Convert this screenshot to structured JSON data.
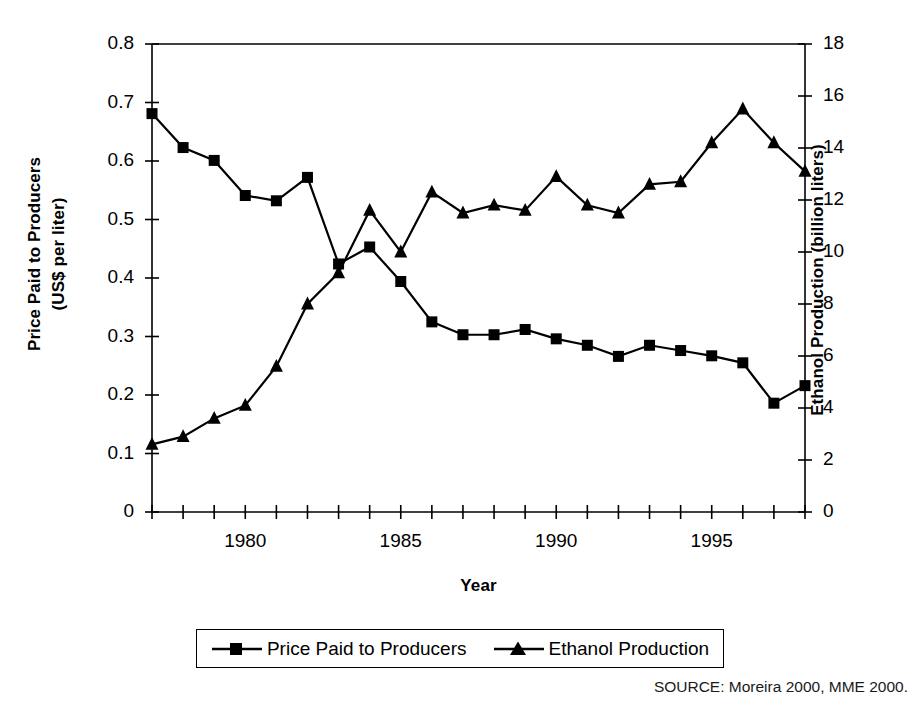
{
  "chart_data": {
    "type": "line",
    "title": "",
    "xlabel": "Year",
    "ylabel": "Price Paid to Producers\n(US$ per liter)",
    "ylabel_right": "Ethanol Production (billion liters)",
    "x": [
      1977,
      1978,
      1979,
      1980,
      1981,
      1982,
      1983,
      1984,
      1985,
      1986,
      1987,
      1988,
      1989,
      1990,
      1991,
      1992,
      1993,
      1994,
      1995,
      1996,
      1997,
      1998
    ],
    "xlim": [
      1977,
      1998
    ],
    "xticks_labeled": [
      "1980",
      "1985",
      "1990",
      "1995"
    ],
    "xticks_labeled_values": [
      1980,
      1985,
      1990,
      1995
    ],
    "xtick_step": 1,
    "ylim": [
      0,
      0.8
    ],
    "yticks": [
      "0",
      "0.1",
      "0.2",
      "0.3",
      "0.4",
      "0.5",
      "0.6",
      "0.7",
      "0.8"
    ],
    "ytick_values": [
      0,
      0.1,
      0.2,
      0.3,
      0.4,
      0.5,
      0.6,
      0.7,
      0.8
    ],
    "ylim_right": [
      0,
      18
    ],
    "yticks_right": [
      "0",
      "2",
      "4",
      "6",
      "8",
      "10",
      "12",
      "14",
      "16",
      "18"
    ],
    "ytick_right_values": [
      0,
      2,
      4,
      6,
      8,
      10,
      12,
      14,
      16,
      18
    ],
    "grid": false,
    "legend_position": "below-center",
    "series": [
      {
        "name": "Price Paid to Producers",
        "marker": "square",
        "axis": "left",
        "values": [
          0.681,
          0.623,
          0.601,
          0.541,
          0.532,
          0.572,
          0.424,
          0.453,
          0.394,
          0.325,
          0.303,
          0.303,
          0.312,
          0.296,
          0.285,
          0.266,
          0.285,
          0.276,
          0.267,
          0.255,
          0.186,
          0.216
        ]
      },
      {
        "name": "Ethanol Production",
        "marker": "triangle",
        "axis": "right",
        "values": [
          2.6,
          2.9,
          3.6,
          4.1,
          5.6,
          8.0,
          9.2,
          11.6,
          10.0,
          12.3,
          11.5,
          11.8,
          11.6,
          12.9,
          11.8,
          11.5,
          12.6,
          12.7,
          14.2,
          15.5,
          14.2,
          13.1
        ]
      }
    ],
    "source": "SOURCE: Moreira 2000, MME 2000."
  },
  "legend": {
    "items": [
      {
        "label": "Price Paid to Producers",
        "marker": "square"
      },
      {
        "label": "Ethanol Production",
        "marker": "triangle"
      }
    ]
  }
}
